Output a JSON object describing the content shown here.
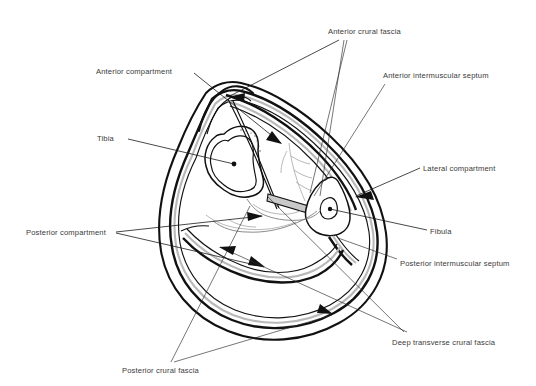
{
  "figure": {
    "background_color": "#ffffff",
    "line_color": "#111111",
    "label_color": "#3a3a3a",
    "fascia_band_color": "#b9b9b9",
    "septum_color": "#c9c9c9"
  },
  "labels": {
    "anterior_compartment": "Anterior compartment",
    "tibia": "Tibia",
    "anterior_crural_fascia": "Anterior crural fascia",
    "anterior_intermuscular_septum": "Anterior intermuscular septum",
    "lateral_compartment": "Lateral compartment",
    "fibula": "Fibula",
    "posterior_intermuscular_septum": "Posterior intermuscular septum",
    "deep_transverse_crural_fascia": "Deep transverse crural fascia",
    "posterior_compartment": "Posterior compartment",
    "posterior_crural_fascia": "Posterior crural fascia"
  },
  "structures": {
    "bones": [
      "tibia",
      "fibula"
    ],
    "compartments": [
      "anterior",
      "lateral",
      "posterior"
    ],
    "fascial_layers": [
      "anterior crural fascia",
      "posterior crural fascia",
      "deep transverse crural fascia",
      "anterior intermuscular septum",
      "posterior intermuscular septum"
    ]
  }
}
